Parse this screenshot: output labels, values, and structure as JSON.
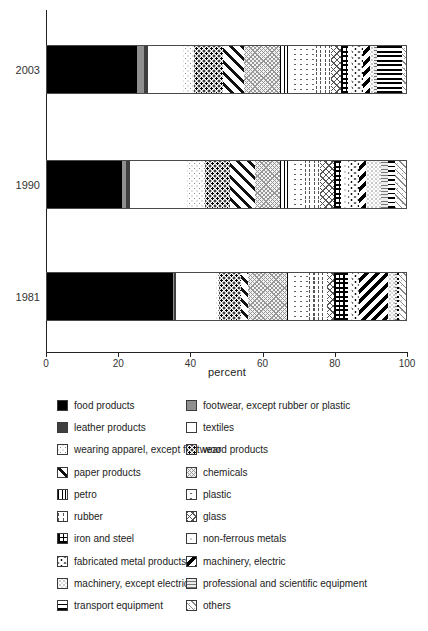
{
  "chart_data": {
    "type": "bar",
    "orientation": "horizontal-stacked",
    "title": "",
    "xlabel": "percent",
    "xlim": [
      0,
      100
    ],
    "xticks": [
      0,
      20,
      40,
      60,
      80,
      100
    ],
    "grid": false,
    "legend_position": "bottom-two-columns",
    "categories": [
      "2003",
      "1990",
      "1981"
    ],
    "series": [
      {
        "name": "food products",
        "pattern": "food",
        "values": [
          25,
          21,
          35
        ]
      },
      {
        "name": "footwear, except rubber or plastic",
        "pattern": "footwear",
        "values": [
          2,
          1,
          0.5
        ]
      },
      {
        "name": "leather products",
        "pattern": "leather",
        "values": [
          1,
          1,
          0.5
        ]
      },
      {
        "name": "textiles",
        "pattern": "textiles",
        "values": [
          10,
          16,
          11
        ]
      },
      {
        "name": "wearing apparel, except footwear",
        "pattern": "wearing",
        "values": [
          3,
          5,
          1
        ]
      },
      {
        "name": "wood products",
        "pattern": "wood",
        "values": [
          8,
          7,
          6
        ]
      },
      {
        "name": "paper products",
        "pattern": "paper",
        "values": [
          6,
          7,
          2
        ]
      },
      {
        "name": "chemicals",
        "pattern": "chemicals",
        "values": [
          10,
          7,
          11
        ]
      },
      {
        "name": "petro",
        "pattern": "petro",
        "values": [
          3,
          3,
          1
        ]
      },
      {
        "name": "plastic",
        "pattern": "plastic",
        "values": [
          7,
          4,
          5
        ]
      },
      {
        "name": "rubber",
        "pattern": "rubber",
        "values": [
          4,
          4,
          5
        ]
      },
      {
        "name": "glass",
        "pattern": "glass",
        "values": [
          3,
          4,
          2
        ]
      },
      {
        "name": "iron and steel",
        "pattern": "iron",
        "values": [
          2,
          2,
          4
        ]
      },
      {
        "name": "non-ferrous metals",
        "pattern": "nonferrous",
        "values": [
          1,
          2,
          1
        ]
      },
      {
        "name": "fabricated metal products",
        "pattern": "fabricated",
        "values": [
          3,
          3,
          2
        ]
      },
      {
        "name": "machinery, electric",
        "pattern": "mach-electric",
        "values": [
          2,
          2,
          8
        ]
      },
      {
        "name": "machinery, except electrical",
        "pattern": "mach-exc",
        "values": [
          1,
          4,
          2
        ]
      },
      {
        "name": "professional and scientific equipment",
        "pattern": "professional",
        "values": [
          1,
          2,
          0.5
        ]
      },
      {
        "name": "transport equipment",
        "pattern": "transport",
        "values": [
          7,
          2,
          0.5
        ]
      },
      {
        "name": "others",
        "pattern": "others",
        "values": [
          1,
          3,
          2
        ]
      }
    ]
  }
}
